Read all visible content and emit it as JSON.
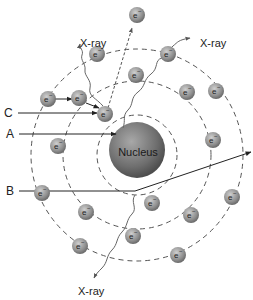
{
  "diagram": {
    "nucleus_label": "Nucleus",
    "electron_label": "e",
    "electron_superscript": "−",
    "xray_labels": [
      "X-ray",
      "X-ray",
      "X-ray"
    ],
    "arrow_labels": {
      "a": "A",
      "b": "B",
      "c": "C"
    },
    "colors": {
      "nucleus": "#7a7a7a",
      "electron": "#9a9a9a",
      "shell": "#555555",
      "line": "#333333"
    },
    "shells": [
      {
        "radius": 36
      },
      {
        "radius": 72
      },
      {
        "radius": 104
      }
    ],
    "electrons": [
      {
        "x": 137,
        "y": 15
      },
      {
        "x": 97,
        "y": 54
      },
      {
        "x": 48,
        "y": 99
      },
      {
        "x": 79,
        "y": 98
      },
      {
        "x": 105,
        "y": 114
      },
      {
        "x": 58,
        "y": 146
      },
      {
        "x": 136,
        "y": 75
      },
      {
        "x": 168,
        "y": 54
      },
      {
        "x": 187,
        "y": 92
      },
      {
        "x": 216,
        "y": 91
      },
      {
        "x": 213,
        "y": 140
      },
      {
        "x": 232,
        "y": 197
      },
      {
        "x": 191,
        "y": 215
      },
      {
        "x": 152,
        "y": 203
      },
      {
        "x": 42,
        "y": 193
      },
      {
        "x": 86,
        "y": 212
      },
      {
        "x": 80,
        "y": 246
      },
      {
        "x": 133,
        "y": 236
      },
      {
        "x": 178,
        "y": 255
      },
      {
        "x": 213,
        "y": 140
      }
    ]
  }
}
